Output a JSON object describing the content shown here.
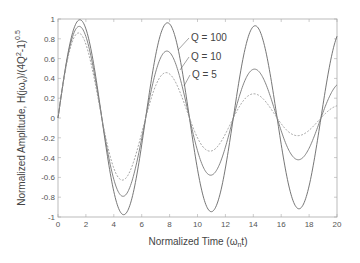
{
  "chart_data": {
    "type": "line",
    "title": "",
    "xlabel": "Normalized Time (ωnt)",
    "ylabel": "Normalized Amplitude, H(jωv)/(4Q²-1)^0.5",
    "xlim": [
      0,
      20
    ],
    "ylim": [
      -1,
      1
    ],
    "xticks": [
      0,
      2,
      4,
      6,
      8,
      10,
      12,
      14,
      16,
      18,
      20
    ],
    "yticks": [
      -1,
      -0.8,
      -0.6,
      -0.4,
      -0.2,
      0,
      0.2,
      0.4,
      0.6,
      0.8,
      1
    ],
    "ytick_labels": [
      "-1",
      "-0.8",
      "-0.6",
      "-0.4",
      "-0.2",
      "0",
      "0.2",
      "0.4",
      "0.6",
      "0.8",
      "1"
    ],
    "grid": false,
    "legend_position": "inline annotations with leader lines",
    "series": [
      {
        "name": "Q = 100",
        "Q": 100,
        "style": "solid",
        "color": "#666666",
        "x": [
          0,
          1.57,
          4.71,
          7.85,
          11.0,
          14.14,
          17.28,
          20
        ],
        "values": [
          0,
          0.99,
          -0.98,
          0.96,
          -0.95,
          0.93,
          -0.92,
          0.82
        ]
      },
      {
        "name": "Q = 10",
        "Q": 10,
        "style": "solid",
        "color": "#777777",
        "x": [
          0,
          1.57,
          4.71,
          7.85,
          11.0,
          14.14,
          17.28,
          20
        ],
        "values": [
          0,
          0.92,
          -0.79,
          0.68,
          -0.58,
          0.49,
          -0.42,
          0.34
        ]
      },
      {
        "name": "Q = 5",
        "Q": 5,
        "style": "dashed",
        "color": "#999999",
        "x": [
          0,
          1.57,
          4.71,
          7.85,
          11.0,
          14.14,
          17.28,
          20
        ],
        "values": [
          0,
          0.85,
          -0.62,
          0.46,
          -0.33,
          0.24,
          -0.18,
          0.12
        ]
      }
    ],
    "annotations": [
      {
        "text": "Q = 100",
        "series": "Q = 100"
      },
      {
        "text": "Q = 10",
        "series": "Q = 10"
      },
      {
        "text": "Q = 5",
        "series": "Q = 5"
      }
    ]
  },
  "labels": {
    "xlabel_main": "Normalized Time (ω",
    "xlabel_sub": "n",
    "xlabel_end": "t)",
    "ylabel_main": "Normalized Amplitude, H(jω",
    "ylabel_sub": "v",
    "ylabel_mid": ")/(4Q",
    "ylabel_sup": "2",
    "ylabel_mid2": "-1)",
    "ylabel_exp": "0.5",
    "legend_q100": "Q = 100",
    "legend_q10": "Q = 10",
    "legend_q5": "Q = 5"
  }
}
